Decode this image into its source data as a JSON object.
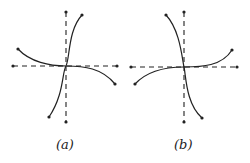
{
  "figure": {
    "panels": [
      {
        "id": "a",
        "label": "(a)",
        "description": "Dashed axes with two curves crossing at origin; one curve rises steeply from lower-left to upper-right, the other descends from upper-left to lower-right flattening at origin",
        "axes": {
          "vertical": {
            "x": 66,
            "y1": 12,
            "y2": 122
          },
          "horizontal": {
            "y": 66,
            "x1": 13,
            "x2": 117
          }
        },
        "curves": [
          {
            "name": "steep-curve",
            "path": "M49,117 C64,95 62,72 66,66 C70,58 68,30 82,15"
          },
          {
            "name": "shallow-curve",
            "path": "M18,49 C30,62 50,66 66,66 C84,66 102,68 115,84"
          }
        ]
      },
      {
        "id": "b",
        "label": "(b)",
        "description": "Mirror image of (a): one curve descends steeply from upper-left to lower-right, the other rises from lower-left to upper-right flattening at origin",
        "axes": {
          "vertical": {
            "x": 184,
            "y1": 12,
            "y2": 122
          },
          "horizontal": {
            "y": 67,
            "x1": 131,
            "x2": 237
          }
        },
        "curves": [
          {
            "name": "steep-curve",
            "path": "M166,15 C180,30 182,58 184,67 C186,76 186,104 202,118"
          },
          {
            "name": "shallow-curve",
            "path": "M135,84 C148,70 166,67 184,67 C202,67 222,66 232,50"
          }
        ]
      }
    ],
    "colors": {
      "line": "#222222",
      "background": "#ffffff"
    }
  }
}
